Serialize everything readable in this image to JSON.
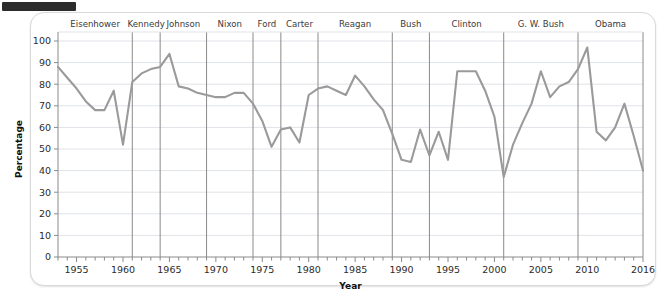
{
  "topbar": {
    "name": "redaction-bar"
  },
  "chart_data": {
    "type": "line",
    "title": "",
    "xlabel": "Year",
    "ylabel": "Percentage",
    "xlim": [
      1953,
      2016
    ],
    "ylim": [
      0,
      100
    ],
    "ytick_step": 10,
    "xtick_step": 1,
    "xlabel_step": 5,
    "grid": true,
    "legend": "none",
    "line_color": "#9a9a9a",
    "yticks": [
      0,
      10,
      20,
      30,
      40,
      50,
      60,
      70,
      80,
      90,
      100
    ],
    "xticklabels": [
      "1955",
      "1960",
      "1965",
      "1970",
      "1975",
      "1980",
      "1985",
      "1990",
      "1995",
      "2000",
      "2005",
      "2010",
      "2016"
    ],
    "xticklabel_values": [
      1955,
      1960,
      1965,
      1970,
      1975,
      1980,
      1985,
      1990,
      1995,
      2000,
      2005,
      2010,
      2016
    ],
    "x": [
      1953,
      1954,
      1955,
      1956,
      1957,
      1958,
      1959,
      1960,
      1961,
      1962,
      1963,
      1964,
      1965,
      1966,
      1967,
      1968,
      1969,
      1970,
      1971,
      1972,
      1973,
      1974,
      1975,
      1976,
      1977,
      1978,
      1979,
      1980,
      1981,
      1982,
      1983,
      1984,
      1985,
      1986,
      1987,
      1988,
      1989,
      1990,
      1991,
      1992,
      1993,
      1994,
      1995,
      1996,
      1997,
      1998,
      1999,
      2000,
      2001,
      2002,
      2003,
      2004,
      2005,
      2006,
      2007,
      2008,
      2009,
      2010,
      2011,
      2012,
      2013,
      2014,
      2015,
      2016
    ],
    "values": [
      88,
      83,
      78,
      72,
      68,
      68,
      77,
      52,
      81,
      85,
      87,
      88,
      94,
      79,
      78,
      76,
      75,
      74,
      74,
      76,
      76,
      71,
      63,
      51,
      59,
      60,
      53,
      75,
      78,
      79,
      77,
      75,
      84,
      79,
      73,
      68,
      57,
      45,
      44,
      59,
      47,
      58,
      45,
      86,
      86,
      86,
      77,
      65,
      37,
      52,
      62,
      71,
      86,
      74,
      79,
      81,
      87,
      97,
      58,
      54,
      60,
      71,
      56,
      40
    ],
    "series_name": "Percentage",
    "annotations": [
      {
        "label": "Eisenhower",
        "start": 1953,
        "end": 1961
      },
      {
        "label": "Kennedy",
        "start": 1961,
        "end": 1964
      },
      {
        "label": "Johnson",
        "start": 1964,
        "end": 1969
      },
      {
        "label": "Nixon",
        "start": 1969,
        "end": 1974
      },
      {
        "label": "Ford",
        "start": 1974,
        "end": 1977
      },
      {
        "label": "Carter",
        "start": 1977,
        "end": 1981
      },
      {
        "label": "Reagan",
        "start": 1981,
        "end": 1989
      },
      {
        "label": "Bush",
        "start": 1989,
        "end": 1993
      },
      {
        "label": "Clinton",
        "start": 1993,
        "end": 2001
      },
      {
        "label": "G. W. Bush",
        "start": 2001,
        "end": 2009
      },
      {
        "label": "Obama",
        "start": 2009,
        "end": 2016
      }
    ],
    "divider_years": [
      1961,
      1964,
      1969,
      1974,
      1977,
      1981,
      1989,
      1993,
      2001,
      2009
    ]
  }
}
